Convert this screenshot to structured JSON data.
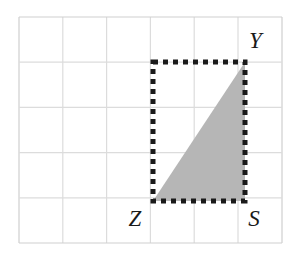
{
  "figure": {
    "type": "geometry-diagram",
    "background_color": "#ffffff",
    "grid": {
      "line_color": "#d6d6d6",
      "border_color": "#c9c9c9",
      "columns": 6,
      "rows": 5,
      "x_start": 19,
      "y_start": 17,
      "cell_width": 43.8,
      "cell_height": 45.2,
      "x_end": 282,
      "y_end": 243
    },
    "rectangle": {
      "name": "dashed-rectangle",
      "stroke_color": "#1a1a1a",
      "stroke_width": 5,
      "dash_on": 5,
      "dash_off": 5,
      "fill": "none",
      "x": 153,
      "y": 62,
      "width": 92,
      "height": 139
    },
    "triangle": {
      "name": "shaded-triangle",
      "fill_color": "#b6b6b6",
      "points": "153,201 245,62 245,201",
      "vertices": [
        {
          "label": "Z",
          "x": 153,
          "y": 201
        },
        {
          "label": "Y",
          "x": 245,
          "y": 62
        },
        {
          "label": "S",
          "x": 245,
          "y": 201
        }
      ]
    },
    "labels": [
      {
        "id": "label-y",
        "text": "Y",
        "x": 249,
        "y": 48,
        "anchor": "start"
      },
      {
        "id": "label-z",
        "text": "Z",
        "x": 135,
        "y": 226,
        "anchor": "middle"
      },
      {
        "id": "label-s",
        "text": "S",
        "x": 254,
        "y": 226,
        "anchor": "middle"
      }
    ]
  }
}
